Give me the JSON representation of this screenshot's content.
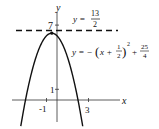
{
  "chart_data": {
    "type": "line",
    "title": "",
    "xlabel": "x",
    "ylabel": "y",
    "x_ticks": [
      {
        "value": -1,
        "label": "-1"
      },
      {
        "value": 3,
        "label": "3"
      }
    ],
    "y_ticks": [
      {
        "value": 1,
        "label": "1"
      },
      {
        "value": 7,
        "label": "7"
      }
    ],
    "xlim": [
      -4.2,
      6.2
    ],
    "ylim": [
      -2.7,
      9.4
    ],
    "series": [
      {
        "name": "parabola",
        "equation": "y = -(x + 1/2)^2 + 25/4",
        "vertex": [
          -0.5,
          6.25
        ],
        "style": "solid"
      },
      {
        "name": "horizontal-line",
        "equation": "y = 13/2",
        "value": 6.5,
        "style": "dashed"
      }
    ],
    "annotations": {
      "line_label": {
        "lhs": "y =",
        "num": "13",
        "den": "2"
      },
      "curve_label": {
        "lhs": "y = −",
        "open": "(",
        "x": "x +",
        "num": "1",
        "den": "2",
        "close": ")",
        "exp": "2",
        "plus": "+",
        "num2": "25",
        "den2": "4"
      }
    }
  }
}
